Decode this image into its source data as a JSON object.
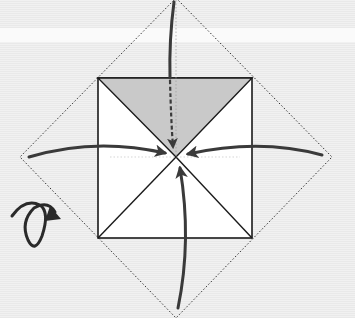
{
  "diagram": {
    "type": "origami-fold-step",
    "colors": {
      "background": "#ececec",
      "band": "#fafafa",
      "paper": "#ffffff",
      "shaded": "#c9c9c9",
      "line": "#1a1a1a",
      "arrow": "#3a3a3a",
      "dotted": "#333333"
    },
    "square": {
      "x1": 98,
      "y1": 78,
      "x2": 252,
      "y2": 238
    },
    "center": {
      "x": 176,
      "y": 157
    },
    "diamond": {
      "top": [
        176,
        -2
      ],
      "right": [
        332,
        157
      ],
      "bottom": [
        176,
        318
      ],
      "left": [
        20,
        157
      ]
    },
    "arrows": [
      {
        "name": "fold-top-corner-arrow",
        "style": "solid-then-dashed",
        "from": "top"
      },
      {
        "name": "fold-left-corner-arrow",
        "style": "solid",
        "from": "left"
      },
      {
        "name": "fold-right-corner-arrow",
        "style": "solid",
        "from": "right"
      },
      {
        "name": "fold-bottom-corner-arrow",
        "style": "solid",
        "from": "bottom"
      }
    ],
    "symbols": [
      {
        "name": "turn-over-icon",
        "meaning": "turn the model over"
      }
    ]
  }
}
